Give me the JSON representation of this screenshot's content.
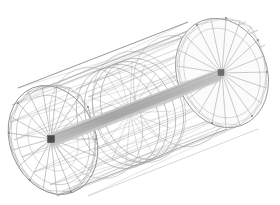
{
  "document": {
    "background_color": "#ffffff",
    "width": 280,
    "height": 205,
    "kind": "3d-wireframe-figure"
  },
  "caption": {
    "visible_text": "",
    "note": "bottom pixel sliver of a clipped text line at top edge; glyphs illegible"
  },
  "figure": {
    "title": "",
    "render_style": "hidden-line wireframe with shaded axle",
    "colors": {
      "background": "#ffffff",
      "mesh_line": "#9a9a9a",
      "mesh_line_light": "#bcbcbc",
      "mesh_line_dark": "#6f6f6f",
      "shaft_fill": "#b4b4b4",
      "shaft_fill_light": "#cfcfcf",
      "shaft_edge": "#8a8a8a",
      "hub_node": "#4a4a4a",
      "disc_fill": "#f2f2f2"
    },
    "geometry": {
      "projection": "oblique axonometric",
      "axis_start": [
        51,
        139
      ],
      "axis_end": [
        221,
        74
      ],
      "left_face": {
        "center": [
          53,
          140
        ],
        "radius_x": 43,
        "radius_y": 56,
        "rotation_deg": -21,
        "spokes": 24
      },
      "right_face": {
        "center": [
          222,
          73
        ],
        "radius_x": 45,
        "radius_y": 56,
        "rotation_deg": -21,
        "spokes": 24
      },
      "inner_rings": [
        {
          "center_t": 0.34,
          "radius_scale": 0.96
        },
        {
          "center_t": 0.42,
          "radius_scale": 0.93
        },
        {
          "center_t": 0.5,
          "radius_scale": 0.9
        }
      ],
      "shell_facets": 16,
      "longitudinal_generators": 16
    },
    "parts": [
      {
        "name": "outer-shell",
        "type": "faceted cylinder surface"
      },
      {
        "name": "left-end-face",
        "type": "spoked disc"
      },
      {
        "name": "right-end-face",
        "type": "spoked disc"
      },
      {
        "name": "central-axle",
        "type": "shaded shaft"
      },
      {
        "name": "left-hub-node",
        "type": "node marker"
      },
      {
        "name": "right-hub-node",
        "type": "node marker"
      }
    ]
  }
}
